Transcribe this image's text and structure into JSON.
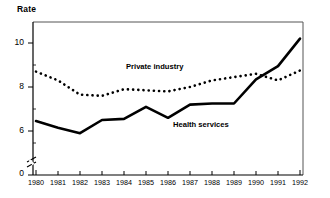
{
  "chart_data": {
    "type": "line",
    "title": "",
    "ylabel": "Rate",
    "xlabel": "",
    "grid": false,
    "legend_position": "inline-annotation",
    "axis_break": true,
    "x": [
      1980,
      1981,
      1982,
      1983,
      1984,
      1985,
      1986,
      1987,
      1988,
      1989,
      1990,
      1991,
      1992
    ],
    "categories": [
      "1980",
      "1981",
      "1982",
      "1983",
      "1984",
      "1985",
      "1986",
      "1987",
      "1988",
      "1989",
      "1990",
      "1991",
      "1992"
    ],
    "ylim": [
      0,
      11
    ],
    "yticks": [
      0,
      6,
      8,
      10
    ],
    "ytick_labels": [
      "0",
      "6",
      "8",
      "10"
    ],
    "series": [
      {
        "name": "Private industry",
        "style": "dotted",
        "color": "#000000",
        "values": [
          8.7,
          8.3,
          7.65,
          7.6,
          7.9,
          7.85,
          7.8,
          8.0,
          8.3,
          8.45,
          8.6,
          8.3,
          8.75
        ]
      },
      {
        "name": "Health services",
        "style": "solid",
        "color": "#000000",
        "values": [
          6.45,
          6.15,
          5.9,
          6.5,
          6.55,
          7.1,
          6.6,
          7.2,
          7.25,
          7.25,
          8.35,
          8.95,
          10.2
        ]
      }
    ],
    "annotations": [
      {
        "text": "Private industry",
        "x": 1984.2,
        "y": 8.85
      },
      {
        "text": "Health services",
        "x": 1986.9,
        "y": 6.55
      }
    ]
  }
}
